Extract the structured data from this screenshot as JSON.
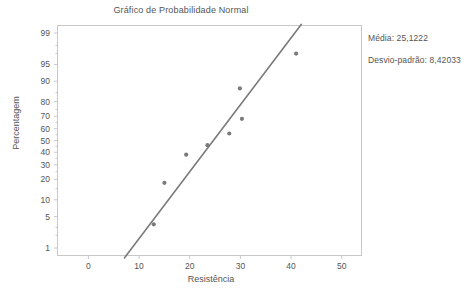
{
  "chart_data": {
    "type": "scatter",
    "title": "Gráfico de Probabilidade Normal",
    "xlabel": "Resistência",
    "ylabel": "Percentagem",
    "x": [
      12.9,
      15.0,
      19.3,
      23.5,
      23.7,
      27.8,
      29.9,
      30.3,
      41.0
    ],
    "y": [
      3.5,
      18.0,
      38.0,
      46.0,
      45.0,
      56.0,
      87.0,
      68.0,
      97.0
    ],
    "points": [
      {
        "x": 12.9,
        "y": 3.5
      },
      {
        "x": 15.0,
        "y": 18.0
      },
      {
        "x": 19.3,
        "y": 38.0
      },
      {
        "x": 23.5,
        "y": 46.0
      },
      {
        "x": 27.8,
        "y": 56.0
      },
      {
        "x": 29.9,
        "y": 87.0
      },
      {
        "x": 30.3,
        "y": 68.0
      },
      {
        "x": 41.0,
        "y": 97.0
      }
    ],
    "fit_line": {
      "x0": 7.1,
      "y0": 0.55,
      "x1": 42.0,
      "y1": 99.4
    },
    "xlim": [
      -6,
      54
    ],
    "xticks": [
      0,
      10,
      20,
      30,
      40,
      50
    ],
    "yticks": [
      1,
      5,
      10,
      20,
      30,
      40,
      50,
      60,
      70,
      80,
      90,
      95,
      99
    ],
    "yticks_minor": [
      2,
      3,
      15,
      25,
      35,
      45,
      55,
      65,
      75,
      85,
      97,
      98
    ],
    "yscale": "probability",
    "grid": false,
    "legend": "none",
    "series_color": "#7a7a7a",
    "line_color": "#7a7a7a",
    "frame_color": "#c8c8c8",
    "annotations": [
      "Média: 25,1222",
      "Desvio-padrão: 8,42033"
    ]
  },
  "stats": {
    "mean_label": "Média: 25,1222",
    "stddev_label": "Desvio-padrão: 8,42033"
  }
}
